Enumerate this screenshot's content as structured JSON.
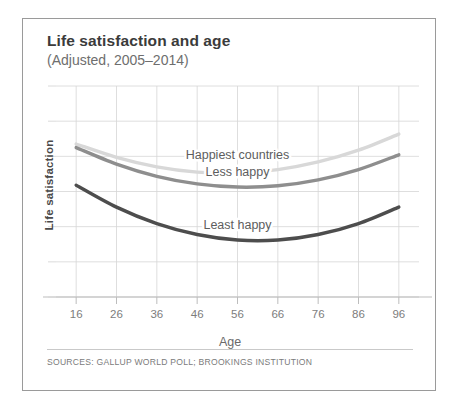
{
  "card": {
    "title": "Life satisfaction and age",
    "subtitle": "(Adjusted, 2005–2014)",
    "sources": "SOURCES: GALLUP WORLD POLL; BROOKINGS INSTITUTION"
  },
  "chart_data": {
    "type": "line",
    "title": "Life satisfaction and age",
    "subtitle": "(Adjusted, 2005–2014)",
    "xlabel": "Age",
    "ylabel": "Life satisfaction",
    "xlim": [
      11,
      101
    ],
    "ylim": [
      0,
      10
    ],
    "grid": true,
    "legend_position": "inline-labels",
    "xticks": [
      16,
      26,
      36,
      46,
      56,
      66,
      76,
      86,
      96
    ],
    "xticklabels": [
      "16",
      "26",
      "36",
      "46",
      "56",
      "66",
      "76",
      "86",
      "96"
    ],
    "yticks": [],
    "yticklabels": [],
    "annotation": "U-shaped life satisfaction curves by age for three country groups",
    "x": [
      16,
      26,
      36,
      46,
      56,
      66,
      76,
      86,
      96
    ],
    "series": [
      {
        "name": "Happiest countries",
        "color": "#d8d8d8",
        "label_x": 56,
        "label_y": 6.55,
        "values": [
          7.25,
          6.62,
          6.17,
          5.92,
          5.88,
          6.04,
          6.4,
          6.96,
          7.72
        ]
      },
      {
        "name": "Less happy",
        "color": "#8e8e8e",
        "label_x": 56,
        "label_y": 5.75,
        "values": [
          7.08,
          6.3,
          5.72,
          5.36,
          5.21,
          5.27,
          5.55,
          6.04,
          6.74
        ]
      },
      {
        "name": "Least happy",
        "color": "#4d4d4d",
        "label_x": 56,
        "label_y": 3.2,
        "values": [
          5.3,
          4.26,
          3.48,
          2.96,
          2.7,
          2.7,
          2.96,
          3.48,
          4.26
        ]
      }
    ]
  }
}
